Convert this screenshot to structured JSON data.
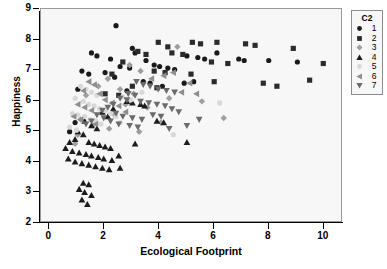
{
  "chart_data": {
    "type": "scatter",
    "title": "",
    "xlabel": "Ecological Footprint",
    "ylabel": "Happiness",
    "xlim": [
      -0.3,
      10.7
    ],
    "ylim": [
      2,
      9
    ],
    "xticks": [
      "0",
      "2",
      "4",
      "6",
      "8",
      "10"
    ],
    "xtick_values": [
      0,
      2,
      4,
      6,
      8,
      10
    ],
    "yticks": [
      "2",
      "3",
      "4",
      "5",
      "6",
      "7",
      "8",
      "9"
    ],
    "ytick_values": [
      2,
      3,
      4,
      5,
      6,
      7,
      8,
      9
    ],
    "grid": false,
    "legend": {
      "title": "C2",
      "position": "right-outside",
      "entries": [
        {
          "label": "1",
          "marker": "circle",
          "color": "#1a1a1a"
        },
        {
          "label": "2",
          "marker": "square",
          "color": "#2b2b2b"
        },
        {
          "label": "3",
          "marker": "diamond",
          "color": "#9e9e9e"
        },
        {
          "label": "4",
          "marker": "triangle-up",
          "color": "#1c1c1c"
        },
        {
          "label": "5",
          "marker": "circle-open",
          "color": "#d8d8d8"
        },
        {
          "label": "6",
          "marker": "triangle-left",
          "color": "#8f8f8f"
        },
        {
          "label": "7",
          "marker": "triangle-down",
          "color": "#6b6b6b"
        }
      ]
    },
    "series": [
      {
        "name": "1",
        "marker": "circle",
        "color": "#1a1a1a",
        "points": [
          [
            2.45,
            8.45
          ],
          [
            1.55,
            7.55
          ],
          [
            1.75,
            7.45
          ],
          [
            2.25,
            7.35
          ],
          [
            3.05,
            7.7
          ],
          [
            3.15,
            7.55
          ],
          [
            3.55,
            7.3
          ],
          [
            2.6,
            7.1
          ],
          [
            2.95,
            7.05
          ],
          [
            3.85,
            7.15
          ],
          [
            4.05,
            7.1
          ],
          [
            4.35,
            7.05
          ],
          [
            1.2,
            6.95
          ],
          [
            1.45,
            6.85
          ],
          [
            2.05,
            6.9
          ],
          [
            2.4,
            6.75
          ],
          [
            4.6,
            7.0
          ],
          [
            5.05,
            7.45
          ],
          [
            5.45,
            7.4
          ],
          [
            5.7,
            7.35
          ],
          [
            6.15,
            7.55
          ],
          [
            6.95,
            7.35
          ],
          [
            7.15,
            7.3
          ],
          [
            8.05,
            7.3
          ],
          [
            9.1,
            7.25
          ],
          [
            3.45,
            6.6
          ],
          [
            3.7,
            6.55
          ],
          [
            4.15,
            6.45
          ],
          [
            1.05,
            6.35
          ],
          [
            0.95,
            5.25
          ],
          [
            0.75,
            4.95
          ],
          [
            2.85,
            6.3
          ],
          [
            4.95,
            6.55
          ],
          [
            5.3,
            6.6
          ]
        ]
      },
      {
        "name": "2",
        "marker": "square",
        "color": "#2b2b2b",
        "points": [
          [
            4.0,
            7.9
          ],
          [
            4.35,
            7.75
          ],
          [
            5.25,
            7.9
          ],
          [
            5.55,
            7.85
          ],
          [
            6.15,
            7.9
          ],
          [
            7.2,
            7.85
          ],
          [
            7.55,
            7.8
          ],
          [
            8.95,
            7.7
          ],
          [
            3.25,
            7.6
          ],
          [
            3.55,
            7.5
          ],
          [
            4.5,
            7.55
          ],
          [
            4.9,
            7.5
          ],
          [
            2.7,
            7.25
          ],
          [
            5.95,
            7.25
          ],
          [
            6.55,
            7.2
          ],
          [
            10.05,
            7.2
          ],
          [
            3.85,
            6.95
          ],
          [
            4.25,
            6.9
          ],
          [
            2.3,
            6.85
          ],
          [
            5.2,
            6.85
          ],
          [
            6.05,
            6.6
          ],
          [
            9.55,
            6.65
          ],
          [
            3.05,
            6.45
          ],
          [
            3.95,
            6.4
          ],
          [
            2.05,
            6.2
          ],
          [
            2.55,
            6.15
          ],
          [
            7.85,
            6.55
          ],
          [
            8.35,
            6.45
          ]
        ]
      },
      {
        "name": "3",
        "marker": "diamond",
        "color": "#9e9e9e",
        "points": [
          [
            4.7,
            7.75
          ],
          [
            2.95,
            7.15
          ],
          [
            3.35,
            6.95
          ],
          [
            2.15,
            6.7
          ],
          [
            1.8,
            6.45
          ],
          [
            2.6,
            6.35
          ],
          [
            3.1,
            6.2
          ],
          [
            1.35,
            6.15
          ],
          [
            4.4,
            6.05
          ],
          [
            5.6,
            5.95
          ],
          [
            2.8,
            5.85
          ],
          [
            3.6,
            5.75
          ],
          [
            1.95,
            5.6
          ],
          [
            2.4,
            5.5
          ],
          [
            6.4,
            5.4
          ],
          [
            1.15,
            5.35
          ],
          [
            4.1,
            5.25
          ],
          [
            1.6,
            5.15
          ],
          [
            2.2,
            5.05
          ],
          [
            3.3,
            4.95
          ],
          [
            1.05,
            4.85
          ],
          [
            0.95,
            4.55
          ]
        ]
      },
      {
        "name": "4",
        "marker": "triangle-up",
        "color": "#1c1c1c",
        "points": [
          [
            2.85,
            5.95
          ],
          [
            3.05,
            5.9
          ],
          [
            3.35,
            5.85
          ],
          [
            3.5,
            5.8
          ],
          [
            2.35,
            5.7
          ],
          [
            1.95,
            5.6
          ],
          [
            2.15,
            5.45
          ],
          [
            1.3,
            5.3
          ],
          [
            1.55,
            5.15
          ],
          [
            1.75,
            5.05
          ],
          [
            3.95,
            5.3
          ],
          [
            4.2,
            5.25
          ],
          [
            1.05,
            4.95
          ],
          [
            1.25,
            4.85
          ],
          [
            0.95,
            4.7
          ],
          [
            1.45,
            4.6
          ],
          [
            1.65,
            4.55
          ],
          [
            1.85,
            4.5
          ],
          [
            2.05,
            4.45
          ],
          [
            2.25,
            4.4
          ],
          [
            0.85,
            4.3
          ],
          [
            1.1,
            4.25
          ],
          [
            1.35,
            4.2
          ],
          [
            1.55,
            4.15
          ],
          [
            1.8,
            4.1
          ],
          [
            2.0,
            4.05
          ],
          [
            2.3,
            4.0
          ],
          [
            2.55,
            4.15
          ],
          [
            0.7,
            4.05
          ],
          [
            0.95,
            3.95
          ],
          [
            1.2,
            3.9
          ],
          [
            1.45,
            3.85
          ],
          [
            1.7,
            3.8
          ],
          [
            1.95,
            3.75
          ],
          [
            2.2,
            3.7
          ],
          [
            2.6,
            3.75
          ],
          [
            1.25,
            3.25
          ],
          [
            1.45,
            3.2
          ],
          [
            1.1,
            3.05
          ],
          [
            1.3,
            2.95
          ],
          [
            1.55,
            2.85
          ],
          [
            1.2,
            2.7
          ],
          [
            1.4,
            2.55
          ],
          [
            0.6,
            4.4
          ],
          [
            0.75,
            4.6
          ],
          [
            3.15,
            4.55
          ],
          [
            5.05,
            4.6
          ]
        ]
      },
      {
        "name": "5",
        "marker": "circle-open",
        "color": "#d8d8d8",
        "points": [
          [
            1.15,
            6.45
          ],
          [
            1.35,
            6.35
          ],
          [
            1.55,
            6.25
          ],
          [
            1.75,
            6.15
          ],
          [
            0.95,
            6.05
          ],
          [
            1.25,
            5.95
          ],
          [
            1.45,
            5.85
          ],
          [
            1.65,
            5.8
          ],
          [
            1.85,
            5.7
          ],
          [
            2.05,
            5.65
          ],
          [
            0.85,
            5.55
          ],
          [
            1.05,
            5.5
          ],
          [
            1.3,
            5.45
          ],
          [
            1.5,
            5.35
          ],
          [
            1.7,
            5.3
          ],
          [
            1.9,
            5.2
          ],
          [
            2.25,
            5.55
          ],
          [
            2.45,
            5.45
          ],
          [
            0.75,
            5.1
          ],
          [
            1.0,
            5.0
          ],
          [
            2.7,
            6.1
          ],
          [
            3.0,
            6.0
          ],
          [
            2.6,
            5.25
          ],
          [
            3.4,
            6.25
          ],
          [
            4.55,
            4.85
          ],
          [
            6.25,
            5.9
          ]
        ]
      },
      {
        "name": "6",
        "marker": "triangle-left",
        "color": "#8f8f8f",
        "points": [
          [
            4.55,
            6.9
          ],
          [
            4.2,
            6.8
          ],
          [
            3.75,
            6.7
          ],
          [
            5.15,
            6.55
          ],
          [
            1.45,
            6.6
          ],
          [
            1.65,
            6.5
          ],
          [
            1.25,
            6.3
          ],
          [
            1.85,
            6.2
          ],
          [
            2.05,
            6.0
          ],
          [
            1.05,
            5.85
          ],
          [
            1.3,
            5.75
          ],
          [
            1.55,
            5.65
          ],
          [
            2.3,
            5.9
          ],
          [
            2.55,
            5.8
          ],
          [
            0.9,
            5.45
          ],
          [
            1.15,
            5.35
          ],
          [
            4.85,
            6.25
          ],
          [
            5.4,
            6.2
          ],
          [
            1.7,
            5.2
          ],
          [
            2.8,
            5.6
          ]
        ]
      },
      {
        "name": "7",
        "marker": "triangle-down",
        "color": "#6b6b6b",
        "points": [
          [
            3.2,
            6.6
          ],
          [
            3.45,
            6.5
          ],
          [
            3.7,
            6.45
          ],
          [
            4.0,
            6.35
          ],
          [
            4.3,
            6.3
          ],
          [
            4.6,
            6.25
          ],
          [
            2.9,
            6.2
          ],
          [
            3.15,
            6.15
          ],
          [
            2.6,
            6.05
          ],
          [
            2.85,
            6.0
          ],
          [
            3.35,
            5.95
          ],
          [
            3.65,
            5.9
          ],
          [
            3.95,
            5.85
          ],
          [
            4.25,
            5.8
          ],
          [
            4.5,
            5.7
          ],
          [
            2.35,
            5.85
          ],
          [
            2.15,
            5.75
          ],
          [
            1.95,
            5.65
          ],
          [
            2.45,
            5.55
          ],
          [
            2.7,
            5.45
          ],
          [
            3.05,
            5.4
          ],
          [
            3.4,
            5.35
          ],
          [
            3.8,
            5.5
          ],
          [
            4.1,
            5.45
          ],
          [
            4.75,
            5.6
          ],
          [
            5.5,
            5.35
          ],
          [
            1.75,
            5.5
          ],
          [
            2.0,
            5.4
          ],
          [
            2.25,
            5.3
          ],
          [
            2.55,
            5.2
          ],
          [
            2.95,
            5.15
          ],
          [
            3.25,
            5.1
          ],
          [
            1.55,
            5.3
          ],
          [
            1.35,
            5.2
          ],
          [
            4.4,
            5.05
          ],
          [
            5.05,
            5.15
          ]
        ]
      }
    ]
  }
}
